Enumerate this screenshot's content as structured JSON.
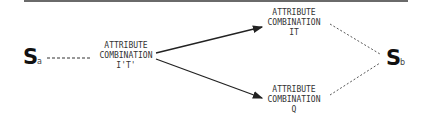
{
  "diagram": {
    "start_node": {
      "symbol": "S",
      "subscript": "a"
    },
    "end_node": {
      "symbol": "S",
      "subscript": "b"
    },
    "middle_node": {
      "lines": [
        "ATTRIBUTE",
        "COMBINATION",
        "I'T'"
      ]
    },
    "upper_node": {
      "lines": [
        "ATTRIBUTE",
        "COMBINATION",
        "IT"
      ]
    },
    "lower_node": {
      "lines": [
        "ATTRIBUTE",
        "COMBINATION",
        "Q"
      ]
    },
    "edges": [
      {
        "from": "S_a",
        "to": "I'T'",
        "style": "dashed"
      },
      {
        "from": "I'T'",
        "to": "IT",
        "style": "solid-arrow"
      },
      {
        "from": "I'T'",
        "to": "Q",
        "style": "solid-arrow"
      },
      {
        "from": "IT",
        "to": "S_b",
        "style": "dashed"
      },
      {
        "from": "Q",
        "to": "S_b",
        "style": "dashed"
      }
    ]
  }
}
